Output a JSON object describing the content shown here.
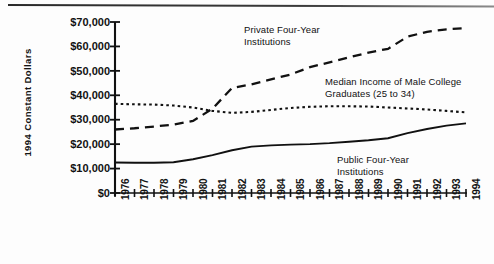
{
  "chart_data": {
    "type": "line",
    "title": "",
    "xlabel": "",
    "ylabel": "1994 Constant Dollars",
    "x": [
      1976,
      1977,
      1978,
      1979,
      1980,
      1981,
      1982,
      1983,
      1984,
      1985,
      1986,
      1987,
      1988,
      1989,
      1990,
      1991,
      1992,
      1993,
      1994
    ],
    "xtick_labels": [
      "1976",
      "1977",
      "1978",
      "1979",
      "1980",
      "1981",
      "1982",
      "1983",
      "1984",
      "1985",
      "1986",
      "1987",
      "1988",
      "1989",
      "1990",
      "1991",
      "1992",
      "1993",
      "1994"
    ],
    "ytick_labels": [
      "$0",
      "$10,000",
      "$20,000",
      "$30,000",
      "$40,000",
      "$50,000",
      "$60,000",
      "$70,000"
    ],
    "ytick_values": [
      0,
      10000,
      20000,
      30000,
      40000,
      50000,
      60000,
      70000
    ],
    "ylim": [
      0,
      70000
    ],
    "xlim": [
      1976,
      1994
    ],
    "grid": false,
    "legend_position": "inline-annotations",
    "series": [
      {
        "name": "Private Four-Year Institutions",
        "style": "dashed",
        "color": "#111111",
        "values": [
          26000,
          26500,
          27200,
          28000,
          29500,
          34500,
          43000,
          44500,
          46500,
          48500,
          51500,
          53500,
          55500,
          57500,
          59000,
          64000,
          66000,
          67000,
          67500
        ]
      },
      {
        "name": "Median Income of Male College Graduates (25 to 34)",
        "style": "dotted",
        "color": "#111111",
        "values": [
          36500,
          36300,
          36200,
          35800,
          35000,
          33600,
          32800,
          33200,
          34000,
          34800,
          35300,
          35500,
          35500,
          35400,
          35000,
          34600,
          34200,
          33600,
          33000
        ]
      },
      {
        "name": "Public Four-Year Institutions",
        "style": "solid",
        "color": "#111111",
        "values": [
          12500,
          12400,
          12400,
          12600,
          13800,
          15500,
          17500,
          19000,
          19500,
          19800,
          20000,
          20400,
          21000,
          21600,
          22400,
          24500,
          26200,
          27600,
          28500
        ]
      }
    ],
    "annotations": [
      {
        "id": "private-label",
        "text": "Private  Four-Year\nInstitutions",
        "x": 244,
        "y": 24
      },
      {
        "id": "median-income-label",
        "text": "Median Income of Male College\nGraduates (25 to 34)",
        "x": 325,
        "y": 76
      },
      {
        "id": "public-label",
        "text": "Public  Four-Year\nInstitutions",
        "x": 337,
        "y": 154
      }
    ]
  }
}
